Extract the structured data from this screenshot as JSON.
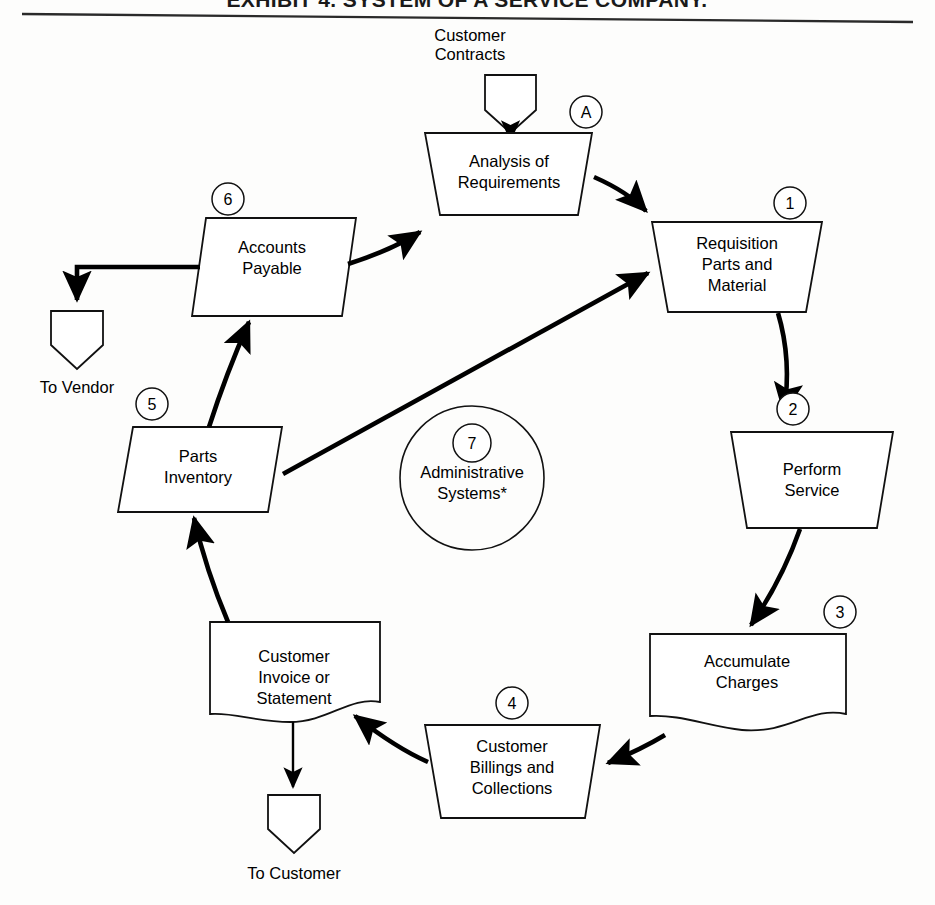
{
  "document": {
    "title": "EXHIBIT 4. SYSTEM OF A SERVICE COMPANY.",
    "footnote_marker": "*"
  },
  "diagram": {
    "type": "cycle-flowchart",
    "inputs": [
      {
        "id": "customer-contracts",
        "label": "Customer\nContracts",
        "label_line1": "Customer",
        "label_line2": "Contracts",
        "shape": "pentagon-down"
      }
    ],
    "outputs": [
      {
        "id": "to-vendor",
        "label": "To Vendor",
        "shape": "pentagon-down"
      },
      {
        "id": "to-customer",
        "label": "To Customer",
        "shape": "pentagon-down"
      }
    ],
    "nodes": [
      {
        "id": "analysis-of-requirements",
        "badge": "A",
        "shape": "trapezoid",
        "lines": [
          "Analysis of",
          "Requirements"
        ]
      },
      {
        "id": "requisition-parts-and-material",
        "badge": "1",
        "shape": "trapezoid",
        "lines": [
          "Requisition",
          "Parts and",
          "Material"
        ]
      },
      {
        "id": "perform-service",
        "badge": "2",
        "shape": "trapezoid",
        "lines": [
          "Perform",
          "Service"
        ]
      },
      {
        "id": "accumulate-charges",
        "badge": "3",
        "shape": "document",
        "lines": [
          "Accumulate",
          "Charges"
        ]
      },
      {
        "id": "customer-billings-and-collections",
        "badge": "4",
        "shape": "trapezoid",
        "lines": [
          "Customer",
          "Billings and",
          "Collections"
        ]
      },
      {
        "id": "customer-invoice-or-statement",
        "badge": "",
        "shape": "document",
        "lines": [
          "Customer",
          "Invoice or",
          "Statement"
        ]
      },
      {
        "id": "parts-inventory",
        "badge": "5",
        "shape": "trapezoid",
        "lines": [
          "Parts",
          "Inventory"
        ]
      },
      {
        "id": "accounts-payable",
        "badge": "6",
        "shape": "trapezoid",
        "lines": [
          "Accounts",
          "Payable"
        ]
      },
      {
        "id": "administrative-systems",
        "badge": "7",
        "shape": "circle",
        "lines": [
          "Administrative",
          "Systems*"
        ]
      }
    ],
    "edges": [
      {
        "from": "customer-contracts",
        "to": "analysis-of-requirements"
      },
      {
        "from": "analysis-of-requirements",
        "to": "requisition-parts-and-material"
      },
      {
        "from": "requisition-parts-and-material",
        "to": "perform-service"
      },
      {
        "from": "perform-service",
        "to": "accumulate-charges"
      },
      {
        "from": "accumulate-charges",
        "to": "customer-billings-and-collections"
      },
      {
        "from": "customer-billings-and-collections",
        "to": "customer-invoice-or-statement"
      },
      {
        "from": "customer-invoice-or-statement",
        "to": "to-customer"
      },
      {
        "from": "customer-invoice-or-statement",
        "to": "parts-inventory"
      },
      {
        "from": "parts-inventory",
        "to": "accounts-payable"
      },
      {
        "from": "parts-inventory",
        "to": "requisition-parts-and-material"
      },
      {
        "from": "accounts-payable",
        "to": "analysis-of-requirements"
      },
      {
        "from": "accounts-payable",
        "to": "to-vendor"
      }
    ]
  },
  "labels": {
    "analysis_l1": "Analysis of",
    "analysis_l2": "Requirements",
    "analysis_badge": "A",
    "requisition_l1": "Requisition",
    "requisition_l2": "Parts and",
    "requisition_l3": "Material",
    "requisition_badge": "1",
    "perform_l1": "Perform",
    "perform_l2": "Service",
    "perform_badge": "2",
    "accumulate_l1": "Accumulate",
    "accumulate_l2": "Charges",
    "accumulate_badge": "3",
    "billings_l1": "Customer",
    "billings_l2": "Billings and",
    "billings_l3": "Collections",
    "billings_badge": "4",
    "invoice_l1": "Customer",
    "invoice_l2": "Invoice or",
    "invoice_l3": "Statement",
    "parts_l1": "Parts",
    "parts_l2": "Inventory",
    "parts_badge": "5",
    "payable_l1": "Accounts",
    "payable_l2": "Payable",
    "payable_badge": "6",
    "admin_l1": "Administrative",
    "admin_l2": "Systems*",
    "admin_badge": "7",
    "contracts_l1": "Customer",
    "contracts_l2": "Contracts",
    "to_vendor": "To Vendor",
    "to_customer": "To Customer",
    "title": "EXHIBIT 4. SYSTEM OF A SERVICE COMPANY."
  },
  "colors": {
    "ink": "#000000",
    "paper": "#fdfdfc",
    "stroke": "#111111"
  }
}
